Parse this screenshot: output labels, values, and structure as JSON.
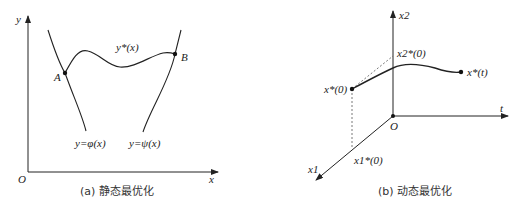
{
  "figure_a": {
    "caption": "(a) 静态最优化",
    "axis_x_label": "x",
    "axis_y_label": "y",
    "origin_label": "O",
    "point_a_label": "A",
    "point_b_label": "B",
    "curve_label": "y*(x)",
    "left_constraint_label": "y=φ(x)",
    "right_constraint_label": "y=ψ(x)"
  },
  "figure_b": {
    "caption": "(b) 动态最优化",
    "axis_x2_label": "x2",
    "axis_t_label": "t",
    "axis_x1_label": "x1",
    "origin_label": "O",
    "start_point_label": "x*(0)",
    "end_point_label": "x*(t)",
    "x2_projection_label": "x2*(0)",
    "x1_projection_label": "x1*(0)"
  },
  "colors": {
    "line": "#222222",
    "dashed": "#555555"
  }
}
